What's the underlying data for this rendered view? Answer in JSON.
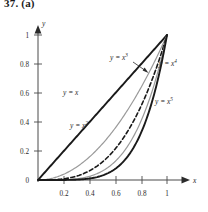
{
  "figure": {
    "problem_number": "37. (a)"
  },
  "axes": {
    "x_axis_label": "x",
    "y_axis_label": "y",
    "x_ticks": [
      "0.2",
      "0.4",
      "0.6",
      "0.8",
      "1"
    ],
    "y_ticks": [
      "0.2",
      "0.4",
      "0.6",
      "0.8",
      "1"
    ],
    "origin_label": "0"
  },
  "curve_labels": [
    {
      "id": "label-y-eq-x",
      "base": "y = x",
      "exponent": ""
    },
    {
      "id": "label-y-eq-x2",
      "base": "y = x",
      "exponent": "2"
    },
    {
      "id": "label-y-eq-x3",
      "base": "y = x",
      "exponent": "3"
    },
    {
      "id": "label-y-eq-x4",
      "base": "y = x",
      "exponent": "4"
    },
    {
      "id": "label-y-eq-x5",
      "base": "y = x",
      "exponent": "5"
    }
  ],
  "colors": {
    "ink": "#1a1a1a",
    "gray_curve": "#9a9a9a",
    "axis": "#4a4a4a",
    "background": "#ffffff"
  },
  "chart_data": {
    "type": "line",
    "title": "37. (a)",
    "xlabel": "x",
    "ylabel": "y",
    "xlim": [
      0,
      1.06
    ],
    "ylim": [
      0,
      1.06
    ],
    "grid": false,
    "legend_position": "inline-annotations",
    "x_ticks": [
      0.2,
      0.4,
      0.6,
      0.8,
      1
    ],
    "y_ticks": [
      0.2,
      0.4,
      0.6,
      0.8,
      1
    ],
    "x": [
      0,
      0.05,
      0.1,
      0.15,
      0.2,
      0.25,
      0.3,
      0.35,
      0.4,
      0.45,
      0.5,
      0.55,
      0.6,
      0.65,
      0.7,
      0.75,
      0.8,
      0.85,
      0.9,
      0.95,
      1
    ],
    "series": [
      {
        "name": "y = x",
        "style": "solid",
        "color": "#1a1a1a",
        "width": 1.9,
        "values": [
          0,
          0.05,
          0.1,
          0.15,
          0.2,
          0.25,
          0.3,
          0.35,
          0.4,
          0.45,
          0.5,
          0.55,
          0.6,
          0.65,
          0.7,
          0.75,
          0.8,
          0.85,
          0.9,
          0.95,
          1
        ]
      },
      {
        "name": "y = x^2",
        "style": "solid",
        "color": "#9a9a9a",
        "width": 1.2,
        "values": [
          0,
          0.0025,
          0.01,
          0.0225,
          0.04,
          0.0625,
          0.09,
          0.1225,
          0.16,
          0.2025,
          0.25,
          0.3025,
          0.36,
          0.4225,
          0.49,
          0.5625,
          0.64,
          0.7225,
          0.81,
          0.9025,
          1
        ]
      },
      {
        "name": "y = x^3",
        "style": "dashed",
        "color": "#1a1a1a",
        "width": 1.6,
        "values": [
          0,
          0.000125,
          0.001,
          0.003375,
          0.008,
          0.015625,
          0.027,
          0.042875,
          0.064,
          0.091125,
          0.125,
          0.166375,
          0.216,
          0.274625,
          0.343,
          0.421875,
          0.512,
          0.614125,
          0.729,
          0.857375,
          1
        ]
      },
      {
        "name": "y = x^4",
        "style": "solid",
        "color": "#9a9a9a",
        "width": 1.2,
        "values": [
          0,
          6.25e-06,
          0.0001,
          0.00050625,
          0.0016,
          0.00390625,
          0.0081,
          0.01500625,
          0.0256,
          0.04100625,
          0.0625,
          0.09150625,
          0.1296,
          0.17850625,
          0.2401,
          0.31640625,
          0.4096,
          0.52200625,
          0.6561,
          0.81450625,
          1
        ]
      },
      {
        "name": "y = x^5",
        "style": "solid",
        "color": "#1a1a1a",
        "width": 1.9,
        "values": [
          0,
          3e-07,
          1e-05,
          7.59e-05,
          0.00032,
          0.0009766,
          0.00243,
          0.0052522,
          0.01024,
          0.0184528,
          0.03125,
          0.0503284,
          0.07776,
          0.1160291,
          0.16807,
          0.2373047,
          0.32768,
          0.4437053,
          0.59049,
          0.7737809,
          1
        ]
      }
    ],
    "annotations": [
      {
        "text": "y = x",
        "x": 0.4,
        "y": 0.62
      },
      {
        "text": "y = x^2",
        "x": 0.27,
        "y": 0.37
      },
      {
        "text": "y = x^3",
        "x": 0.63,
        "y": 0.88,
        "leader_to": {
          "x": 0.8,
          "y": 0.75
        }
      },
      {
        "text": "y = x^4",
        "x": 0.92,
        "y": 0.855
      },
      {
        "text": "y = x^5",
        "x": 0.9,
        "y": 0.56
      }
    ]
  }
}
